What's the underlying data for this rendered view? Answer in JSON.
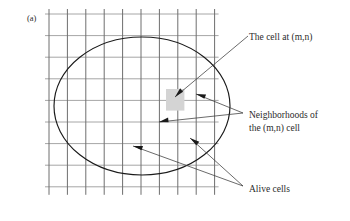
{
  "figure": {
    "panel_label": "(a)",
    "background_color": "#ffffff",
    "grid": {
      "columns": 10,
      "rows": 9,
      "x_start": 49,
      "y_start": 14,
      "cell_width": 18.4,
      "cell_height": 21.6,
      "vertical_line_color": "#6e6e6e",
      "horizontal_line_color": "#a6a6a6"
    },
    "ellipse": {
      "center_x": 142,
      "center_y": 106,
      "radius_x": 88,
      "radius_y": 69,
      "stroke_color": "#1a1a1a"
    },
    "alive_cell": {
      "x": 166,
      "y": 89,
      "width": 18.4,
      "height": 21.6,
      "fill_color": "#d4d4d4"
    },
    "callouts": [
      {
        "id": "cell-mn",
        "lines": [
          "The cell at (m,n)"
        ],
        "text_x": 249,
        "text_y": 40,
        "pointers": [
          {
            "x1": 248,
            "y1": 36,
            "x2": 175,
            "y2": 97
          }
        ]
      },
      {
        "id": "neighborhoods",
        "lines": [
          "Neighborhoods of",
          "the (m,n) cell"
        ],
        "text_x": 249,
        "text_y": 118,
        "pointers": [
          {
            "x1": 243,
            "y1": 113,
            "x2": 196,
            "y2": 94
          },
          {
            "x1": 243,
            "y1": 113,
            "x2": 159,
            "y2": 122
          }
        ]
      },
      {
        "id": "alive-cells",
        "lines": [
          "Alive cells"
        ],
        "text_x": 249,
        "text_y": 192,
        "pointers": [
          {
            "x1": 243,
            "y1": 186,
            "x2": 190,
            "y2": 138
          },
          {
            "x1": 243,
            "y1": 186,
            "x2": 133,
            "y2": 146
          }
        ]
      }
    ]
  }
}
